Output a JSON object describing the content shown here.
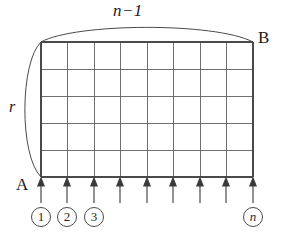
{
  "figure": {
    "type": "geometry-diagram",
    "labels": {
      "top_arc": "n−1",
      "left_arc": "r",
      "point_a": "A",
      "point_b": "B"
    },
    "grid": {
      "columns": 8,
      "rows": 5,
      "left": 41,
      "top": 42,
      "right": 253,
      "bottom": 177,
      "line_color": "#5a5a5a",
      "line_width": 1.0
    },
    "arcs": {
      "top": {
        "label": "n−1",
        "from_x": 41,
        "from_y": 42,
        "to_x": 253,
        "to_y": 42,
        "peak_y": 25,
        "color": "#4a4a4a"
      },
      "left": {
        "label": "r",
        "from_x": 41,
        "from_y": 42,
        "to_x": 41,
        "to_y": 177,
        "bulge_x": 19,
        "color": "#4a4a4a"
      }
    },
    "arrows": {
      "count": 9,
      "direction": "up",
      "color": "#3a3a3a",
      "tip_y": 181,
      "tail_y": 203,
      "x_positions": [
        41,
        67,
        94,
        120,
        147,
        173,
        200,
        226,
        253
      ]
    },
    "indices": [
      {
        "label": "1",
        "x": 41,
        "italic": false
      },
      {
        "label": "2",
        "x": 67,
        "italic": false
      },
      {
        "label": "3",
        "x": 94,
        "italic": false
      },
      {
        "label": "n",
        "x": 253,
        "italic": true
      }
    ],
    "colors": {
      "background": "#ffffff",
      "ink": "#1a1a1a",
      "grid": "#5a5a5a",
      "arc": "#4a4a4a"
    }
  }
}
